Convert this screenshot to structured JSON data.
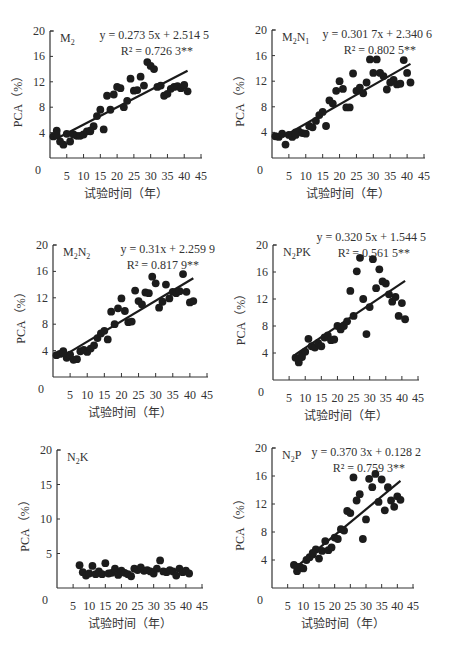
{
  "chart_data": [
    {
      "type": "scatter",
      "panel_label": "M2",
      "label_main": "M",
      "label_sub": "2",
      "label_rest": "",
      "equation": "y = 0.273 5x + 2.514 5",
      "r2": "R² = 0.726 3**",
      "slope": 0.2735,
      "intercept": 2.5145,
      "fit_range": [
        2,
        41
      ],
      "xlabel": "试验时间（年）",
      "ylabel": "PCA（%）",
      "xticks": [
        0,
        5,
        10,
        15,
        20,
        25,
        30,
        35,
        40,
        45
      ],
      "yticks": [
        4,
        8,
        12,
        16,
        20
      ],
      "xlim": [
        0,
        45
      ],
      "ylim": [
        0,
        20
      ],
      "points": [
        [
          1,
          3.4
        ],
        [
          2,
          3.6
        ],
        [
          3,
          2.6
        ],
        [
          4,
          2.1
        ],
        [
          5,
          3.8
        ],
        [
          6,
          2.6
        ],
        [
          7,
          3.7
        ],
        [
          8,
          3.5
        ],
        [
          9,
          3.5
        ],
        [
          10,
          3.7
        ],
        [
          11,
          4.2
        ],
        [
          12,
          4.3
        ],
        [
          13,
          5.0
        ],
        [
          14,
          6.6
        ],
        [
          15,
          7.6
        ],
        [
          16,
          4.5
        ],
        [
          17,
          9.8
        ],
        [
          18,
          7.6
        ],
        [
          19,
          10.0
        ],
        [
          20,
          11.2
        ],
        [
          21,
          11.0
        ],
        [
          22,
          8.0
        ],
        [
          23,
          9.0
        ],
        [
          24,
          12.5
        ],
        [
          25,
          10.6
        ],
        [
          26,
          10.7
        ],
        [
          27,
          12.8
        ],
        [
          28,
          11.4
        ],
        [
          29,
          15.1
        ],
        [
          30,
          14.5
        ],
        [
          31,
          14.0
        ],
        [
          32,
          11.2
        ],
        [
          33,
          11.4
        ],
        [
          34,
          9.8
        ],
        [
          35,
          10.1
        ],
        [
          36,
          10.9
        ],
        [
          37,
          11.2
        ],
        [
          38,
          11.3
        ],
        [
          39,
          11.0
        ],
        [
          40,
          11.5
        ],
        [
          41,
          10.5
        ],
        [
          2,
          4.3
        ],
        [
          12,
          4.2
        ]
      ],
      "frame": {
        "x0": 50,
        "y0": 158,
        "x45": 201,
        "y20": 31
      }
    },
    {
      "type": "scatter",
      "panel_label": "M2N1",
      "label_main": "M",
      "label_sub": "2",
      "label_rest": "N",
      "label_sub2": "1",
      "equation": "y = 0.301 7x + 2.340 6",
      "r2": "R² = 0.802 5**",
      "slope": 0.3017,
      "intercept": 2.3406,
      "fit_range": [
        3,
        41
      ],
      "xlabel": "试验时间（年）",
      "ylabel": "PCA（%）",
      "xticks": [
        0,
        5,
        10,
        15,
        20,
        25,
        30,
        35,
        40,
        45
      ],
      "yticks": [
        4,
        8,
        12,
        16,
        20
      ],
      "xlim": [
        0,
        45
      ],
      "ylim": [
        0,
        20
      ],
      "points": [
        [
          1,
          3.4
        ],
        [
          2,
          3.3
        ],
        [
          3,
          3.8
        ],
        [
          4,
          2.1
        ],
        [
          5,
          3.6
        ],
        [
          6,
          3.3
        ],
        [
          7,
          4.0
        ],
        [
          8,
          4.1
        ],
        [
          9,
          3.9
        ],
        [
          10,
          3.8
        ],
        [
          11,
          5.0
        ],
        [
          12,
          4.8
        ],
        [
          13,
          5.8
        ],
        [
          14,
          6.7
        ],
        [
          15,
          7.2
        ],
        [
          16,
          5.0
        ],
        [
          17,
          9.0
        ],
        [
          18,
          8.5
        ],
        [
          19,
          10.5
        ],
        [
          20,
          12.0
        ],
        [
          21,
          10.8
        ],
        [
          22,
          7.9
        ],
        [
          23,
          7.9
        ],
        [
          24,
          13.2
        ],
        [
          25,
          10.5
        ],
        [
          26,
          11.0
        ],
        [
          27,
          10.1
        ],
        [
          28,
          11.8
        ],
        [
          29,
          15.4
        ],
        [
          30,
          13.3
        ],
        [
          31,
          15.4
        ],
        [
          32,
          13.3
        ],
        [
          33,
          12.8
        ],
        [
          34,
          10.7
        ],
        [
          35,
          11.8
        ],
        [
          36,
          12.2
        ],
        [
          37,
          11.5
        ],
        [
          38,
          11.6
        ],
        [
          39,
          15.3
        ],
        [
          40,
          13.3
        ],
        [
          41,
          11.8
        ],
        [
          7,
          3.6
        ]
      ],
      "frame": {
        "x0": 272,
        "y0": 158,
        "x45": 424,
        "y20": 30
      }
    },
    {
      "type": "scatter",
      "panel_label": "M2N2",
      "label_main": "M",
      "label_sub": "2",
      "label_rest": "N",
      "label_sub2": "2",
      "equation": "y = 0.31x + 2.259 9",
      "r2": "R² = 0.817 9**",
      "slope": 0.31,
      "intercept": 2.2599,
      "fit_range": [
        5,
        41
      ],
      "xlabel": "试验时间（年）",
      "ylabel": "PCA（%）",
      "xticks": [
        0,
        5,
        10,
        15,
        20,
        25,
        30,
        35,
        40,
        45
      ],
      "yticks": [
        4,
        8,
        12,
        16,
        20
      ],
      "xlim": [
        0,
        45
      ],
      "ylim": [
        0,
        20
      ],
      "points": [
        [
          1,
          3.3
        ],
        [
          2,
          3.5
        ],
        [
          3,
          3.9
        ],
        [
          4,
          2.9
        ],
        [
          5,
          3.4
        ],
        [
          6,
          2.6
        ],
        [
          7,
          2.7
        ],
        [
          8,
          3.9
        ],
        [
          9,
          4.1
        ],
        [
          10,
          3.8
        ],
        [
          11,
          4.3
        ],
        [
          12,
          4.8
        ],
        [
          13,
          5.9
        ],
        [
          14,
          6.6
        ],
        [
          15,
          7.0
        ],
        [
          16,
          5.7
        ],
        [
          17,
          9.9
        ],
        [
          18,
          8.0
        ],
        [
          19,
          10.4
        ],
        [
          20,
          11.9
        ],
        [
          21,
          10.0
        ],
        [
          22,
          8.3
        ],
        [
          23,
          8.4
        ],
        [
          24,
          13.1
        ],
        [
          25,
          11.5
        ],
        [
          26,
          11.0
        ],
        [
          27,
          12.8
        ],
        [
          28,
          12.7
        ],
        [
          29,
          15.2
        ],
        [
          30,
          14.2
        ],
        [
          31,
          10.5
        ],
        [
          32,
          11.4
        ],
        [
          33,
          14.0
        ],
        [
          34,
          11.9
        ],
        [
          35,
          12.9
        ],
        [
          36,
          12.7
        ],
        [
          37,
          13.0
        ],
        [
          38,
          15.6
        ],
        [
          39,
          12.9
        ],
        [
          40,
          11.3
        ],
        [
          41,
          11.5
        ],
        [
          3,
          3.6
        ]
      ],
      "frame": {
        "x0": 53,
        "y0": 377,
        "x45": 207,
        "y20": 245
      }
    },
    {
      "type": "scatter",
      "panel_label": "N2PK",
      "label_main": "N",
      "label_sub": "2",
      "label_rest": "PK",
      "equation": "y = 0.320 5x + 1.544 5",
      "r2": "R² = 0.561 5**",
      "slope": 0.3205,
      "intercept": 1.5445,
      "fit_range": [
        7,
        41
      ],
      "xlabel": "试验时间（年）",
      "ylabel": "PCA（%）",
      "xticks": [
        0,
        5,
        10,
        15,
        20,
        25,
        30,
        35,
        40,
        45
      ],
      "yticks": [
        4,
        8,
        12,
        16,
        20
      ],
      "xlim": [
        0,
        45
      ],
      "ylim": [
        0,
        20
      ],
      "points": [
        [
          7,
          3.3
        ],
        [
          8,
          2.6
        ],
        [
          9,
          3.8
        ],
        [
          10,
          4.2
        ],
        [
          11,
          6.1
        ],
        [
          12,
          5.0
        ],
        [
          13,
          4.8
        ],
        [
          14,
          5.5
        ],
        [
          15,
          5.0
        ],
        [
          16,
          6.3
        ],
        [
          17,
          6.6
        ],
        [
          18,
          5.9
        ],
        [
          19,
          6.0
        ],
        [
          20,
          8.0
        ],
        [
          21,
          7.5
        ],
        [
          22,
          8.0
        ],
        [
          23,
          8.7
        ],
        [
          24,
          13.2
        ],
        [
          25,
          9.5
        ],
        [
          26,
          16.1
        ],
        [
          27,
          18.1
        ],
        [
          28,
          12.0
        ],
        [
          29,
          6.8
        ],
        [
          30,
          10.8
        ],
        [
          31,
          17.9
        ],
        [
          32,
          13.6
        ],
        [
          33,
          16.4
        ],
        [
          34,
          14.6
        ],
        [
          35,
          14.3
        ],
        [
          36,
          12.7
        ],
        [
          37,
          11.6
        ],
        [
          38,
          12.3
        ],
        [
          39,
          9.5
        ],
        [
          40,
          11.4
        ],
        [
          41,
          9.0
        ],
        [
          8,
          3.1
        ],
        [
          9,
          3.4
        ]
      ],
      "frame": {
        "x0": 273,
        "y0": 380,
        "x45": 418,
        "y20": 245
      }
    },
    {
      "type": "scatter",
      "panel_label": "N2K",
      "label_main": "N",
      "label_sub": "2",
      "label_rest": "K",
      "equation": "",
      "r2": "",
      "slope": null,
      "intercept": null,
      "fit_range": null,
      "xlabel": "试验时间（年）",
      "ylabel": "PCA（%）",
      "xticks": [
        0,
        5,
        10,
        15,
        20,
        25,
        30,
        35,
        40,
        45
      ],
      "yticks": [
        5,
        10,
        15,
        20
      ],
      "xlim": [
        0,
        45
      ],
      "ylim": [
        0,
        20
      ],
      "points": [
        [
          7,
          3.3
        ],
        [
          8,
          2.3
        ],
        [
          9,
          1.8
        ],
        [
          10,
          2.1
        ],
        [
          11,
          3.2
        ],
        [
          12,
          2.0
        ],
        [
          13,
          2.4
        ],
        [
          14,
          2.0
        ],
        [
          15,
          3.6
        ],
        [
          16,
          2.1
        ],
        [
          17,
          2.2
        ],
        [
          18,
          2.8
        ],
        [
          19,
          1.9
        ],
        [
          20,
          2.5
        ],
        [
          21,
          2.2
        ],
        [
          22,
          2.0
        ],
        [
          23,
          1.7
        ],
        [
          24,
          2.8
        ],
        [
          25,
          2.6
        ],
        [
          26,
          3.0
        ],
        [
          27,
          2.5
        ],
        [
          28,
          2.6
        ],
        [
          29,
          2.4
        ],
        [
          30,
          2.1
        ],
        [
          31,
          2.8
        ],
        [
          32,
          4.0
        ],
        [
          33,
          2.4
        ],
        [
          34,
          2.3
        ],
        [
          35,
          2.6
        ],
        [
          36,
          2.4
        ],
        [
          37,
          1.8
        ],
        [
          38,
          2.8
        ],
        [
          39,
          2.3
        ],
        [
          40,
          2.5
        ],
        [
          41,
          2.1
        ]
      ],
      "frame": {
        "x0": 57,
        "y0": 588,
        "x45": 202,
        "y20": 450
      }
    },
    {
      "type": "scatter",
      "panel_label": "N2P",
      "label_main": "N",
      "label_sub": "2",
      "label_rest": "P",
      "equation": "y = 0.370 3x + 0.128 2",
      "r2": "R² = 0.759 3**",
      "slope": 0.3703,
      "intercept": 0.1282,
      "fit_range": [
        8,
        41
      ],
      "xlabel": "试验时间（年）",
      "ylabel": "PCA（%）",
      "xticks": [
        0,
        5,
        10,
        15,
        20,
        25,
        30,
        35,
        40,
        45
      ],
      "yticks": [
        4,
        8,
        12,
        16,
        20
      ],
      "xlim": [
        0,
        45
      ],
      "ylim": [
        0,
        20
      ],
      "points": [
        [
          7,
          3.3
        ],
        [
          8,
          2.4
        ],
        [
          9,
          3.0
        ],
        [
          10,
          2.8
        ],
        [
          11,
          4.0
        ],
        [
          12,
          4.4
        ],
        [
          13,
          4.8
        ],
        [
          14,
          5.5
        ],
        [
          15,
          4.2
        ],
        [
          16,
          5.3
        ],
        [
          17,
          6.7
        ],
        [
          18,
          5.4
        ],
        [
          19,
          5.8
        ],
        [
          20,
          7.2
        ],
        [
          21,
          7.0
        ],
        [
          22,
          8.4
        ],
        [
          23,
          8.2
        ],
        [
          24,
          11.0
        ],
        [
          25,
          10.7
        ],
        [
          26,
          15.8
        ],
        [
          27,
          12.5
        ],
        [
          28,
          13.4
        ],
        [
          29,
          7.0
        ],
        [
          30,
          9.8
        ],
        [
          31,
          15.6
        ],
        [
          32,
          14.4
        ],
        [
          33,
          16.3
        ],
        [
          34,
          12.3
        ],
        [
          35,
          15.5
        ],
        [
          36,
          11.1
        ],
        [
          37,
          14.4
        ],
        [
          38,
          12.5
        ],
        [
          39,
          11.6
        ],
        [
          40,
          13.1
        ],
        [
          41,
          12.6
        ],
        [
          8,
          3.0
        ],
        [
          13,
          5.0
        ]
      ],
      "frame": {
        "x0": 272,
        "y0": 588,
        "x45": 413,
        "y20": 448
      }
    }
  ]
}
